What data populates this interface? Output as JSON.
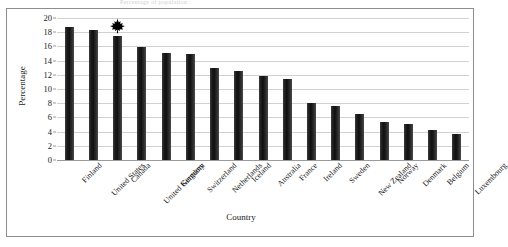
{
  "figure": {
    "clipped_title": "Percentage of population",
    "frame_color": "#8d8d8d",
    "bar_color": "#262626",
    "grid_color": "#d2d2d2"
  },
  "marker": {
    "name": "maple-leaf-icon",
    "country": "Canada",
    "color": "#000000"
  },
  "chart_data": {
    "type": "bar",
    "title": "",
    "xlabel": "Country",
    "ylabel": "Percentage",
    "ylim": [
      0,
      20
    ],
    "ytick_step": 2,
    "yticks": [
      0,
      2,
      4,
      6,
      8,
      10,
      12,
      14,
      16,
      18,
      20
    ],
    "ytick_labels": [
      "0",
      "2",
      "4",
      "6",
      "8",
      "10",
      "12",
      "14",
      "16",
      "18",
      "20"
    ],
    "grid": true,
    "grid_axis": "y",
    "legend": false,
    "categories": [
      "Finland",
      "United States",
      "Canada",
      "United Kingdom",
      "Germany",
      "Switzerland",
      "Netherlands",
      "Iceland",
      "Australia",
      "France",
      "Ireland",
      "Sweden",
      "New Zealand",
      "Norway",
      "Denmark",
      "Belgium",
      "Luxembourg"
    ],
    "values": [
      18.8,
      18.3,
      17.5,
      15.9,
      15.1,
      14.9,
      12.9,
      12.6,
      11.8,
      11.4,
      8.0,
      7.6,
      6.5,
      5.4,
      5.1,
      4.2,
      3.6
    ],
    "annotations": [
      {
        "category": "Canada",
        "marker": "maple-leaf",
        "value": 17.5
      }
    ]
  }
}
